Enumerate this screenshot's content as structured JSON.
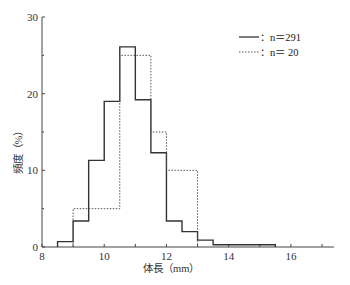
{
  "chart_data": {
    "type": "bar",
    "subtype": "step-histogram",
    "title": "",
    "xlabel": "体長（mm）",
    "ylabel": "頻度（%）",
    "xlim": [
      8,
      17
    ],
    "ylim": [
      0,
      30
    ],
    "x_ticks": [
      8,
      10,
      12,
      14,
      16
    ],
    "y_ticks": [
      0,
      10,
      20,
      30
    ],
    "grid": false,
    "legend_position": "upper right",
    "bin_width": 0.5,
    "series": [
      {
        "name": "n=291",
        "legend_label": "：n＝291",
        "line_style": "solid",
        "bins": [
          {
            "x0": 8.5,
            "x1": 9.0,
            "value": 0.7
          },
          {
            "x0": 9.0,
            "x1": 9.5,
            "value": 3.4
          },
          {
            "x0": 9.5,
            "x1": 10.0,
            "value": 11.3
          },
          {
            "x0": 10.0,
            "x1": 10.5,
            "value": 19.0
          },
          {
            "x0": 10.5,
            "x1": 11.0,
            "value": 26.1
          },
          {
            "x0": 11.0,
            "x1": 11.5,
            "value": 19.2
          },
          {
            "x0": 11.5,
            "x1": 12.0,
            "value": 12.3
          },
          {
            "x0": 12.0,
            "x1": 12.5,
            "value": 3.4
          },
          {
            "x0": 12.5,
            "x1": 13.0,
            "value": 2.0
          },
          {
            "x0": 13.0,
            "x1": 13.5,
            "value": 0.9
          },
          {
            "x0": 13.5,
            "x1": 14.0,
            "value": 0.3
          },
          {
            "x0": 14.0,
            "x1": 14.5,
            "value": 0.3
          },
          {
            "x0": 14.5,
            "x1": 15.0,
            "value": 0.3
          },
          {
            "x0": 15.0,
            "x1": 15.5,
            "value": 0.3
          }
        ]
      },
      {
        "name": "n=20",
        "legend_label": "：n＝ 20",
        "line_style": "dotted",
        "bins": [
          {
            "x0": 9.0,
            "x1": 9.5,
            "value": 5
          },
          {
            "x0": 9.5,
            "x1": 10.0,
            "value": 5
          },
          {
            "x0": 10.0,
            "x1": 10.5,
            "value": 5
          },
          {
            "x0": 10.5,
            "x1": 11.0,
            "value": 25
          },
          {
            "x0": 11.0,
            "x1": 11.5,
            "value": 25
          },
          {
            "x0": 11.5,
            "x1": 12.0,
            "value": 15
          },
          {
            "x0": 12.0,
            "x1": 12.5,
            "value": 10
          },
          {
            "x0": 12.5,
            "x1": 13.0,
            "value": 10
          }
        ]
      }
    ]
  },
  "legend": {
    "items": [
      {
        "label": "：n＝291",
        "style": "solid"
      },
      {
        "label": "：n＝ 20",
        "style": "dotted"
      }
    ]
  },
  "axes": {
    "x_title": "体長（mm）",
    "y_title": "頻度（%）",
    "x_tick_labels": [
      "8",
      "10",
      "12",
      "14",
      "16"
    ],
    "y_tick_labels": [
      "0",
      "10",
      "20",
      "30"
    ]
  },
  "colors": {
    "line": "#333333",
    "text": "#333333",
    "background": "#ffffff"
  }
}
